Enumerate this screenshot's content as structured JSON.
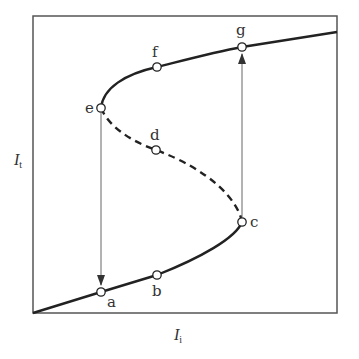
{
  "diagram": {
    "type": "hysteresis-s-curve",
    "axes": {
      "x_label": "I",
      "x_subscript": "i",
      "y_label": "I",
      "y_subscript": "t"
    },
    "points": [
      {
        "id": "a",
        "label": "a",
        "x": 101,
        "y": 292
      },
      {
        "id": "b",
        "label": "b",
        "x": 157,
        "y": 275
      },
      {
        "id": "c",
        "label": "c",
        "x": 242,
        "y": 222
      },
      {
        "id": "d",
        "label": "d",
        "x": 156,
        "y": 150
      },
      {
        "id": "e",
        "label": "e",
        "x": 101,
        "y": 108
      },
      {
        "id": "f",
        "label": "f",
        "x": 157,
        "y": 67
      },
      {
        "id": "g",
        "label": "g",
        "x": 242,
        "y": 47
      }
    ],
    "branches": [
      {
        "name": "lower-stable",
        "style": "solid",
        "from": "origin",
        "to": "c"
      },
      {
        "name": "middle-unstable",
        "style": "dashed",
        "from": "c",
        "to": "e"
      },
      {
        "name": "upper-stable",
        "style": "solid",
        "from": "e",
        "to": "end"
      }
    ],
    "transitions": [
      {
        "from": "e",
        "to": "a",
        "direction": "down"
      },
      {
        "from": "c",
        "to": "g",
        "direction": "up"
      }
    ],
    "colors": {
      "curve": "#222222",
      "frame": "#555555",
      "arrow": "#666666",
      "text": "#333333"
    }
  }
}
